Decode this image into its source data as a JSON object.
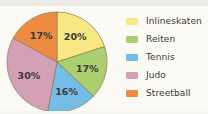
{
  "chart_data": {
    "type": "pie",
    "title": "",
    "legend_position": "right",
    "start_angle_deg": 0,
    "direction": "clockwise",
    "categories": [
      "Inlineskaten",
      "Reiten",
      "Tennis",
      "Judo",
      "Streetball"
    ],
    "values": [
      20,
      17,
      16,
      30,
      17
    ],
    "value_unit": "%",
    "data_labels": [
      "20%",
      "17%",
      "16%",
      "30%",
      "17%"
    ],
    "colors": [
      "#f7e884",
      "#a9cf6e",
      "#74bde6",
      "#d4a0b8",
      "#ef8a43"
    ],
    "slices": [
      {
        "label": "Inlineskaten",
        "value": 20,
        "data_label": "20%",
        "color": "#f7e884"
      },
      {
        "label": "Reiten",
        "value": 17,
        "data_label": "17%",
        "color": "#a9cf6e"
      },
      {
        "label": "Tennis",
        "value": 16,
        "data_label": "16%",
        "color": "#74bde6"
      },
      {
        "label": "Judo",
        "value": 30,
        "data_label": "30%",
        "color": "#d4a0b8"
      },
      {
        "label": "Streetball",
        "value": 17,
        "data_label": "17%",
        "color": "#ef8a43"
      }
    ]
  },
  "legend": {
    "items": [
      {
        "label": "Inlineskaten",
        "color": "#f7e884"
      },
      {
        "label": "Reiten",
        "color": "#a9cf6e"
      },
      {
        "label": "Tennis",
        "color": "#74bde6"
      },
      {
        "label": "Judo",
        "color": "#d4a0b8"
      },
      {
        "label": "Streetball",
        "color": "#ef8a43"
      }
    ]
  },
  "style": {
    "page_background": "#fbfaf4",
    "slice_outline": "#8d7a52",
    "label_text": "#3b3a36"
  }
}
